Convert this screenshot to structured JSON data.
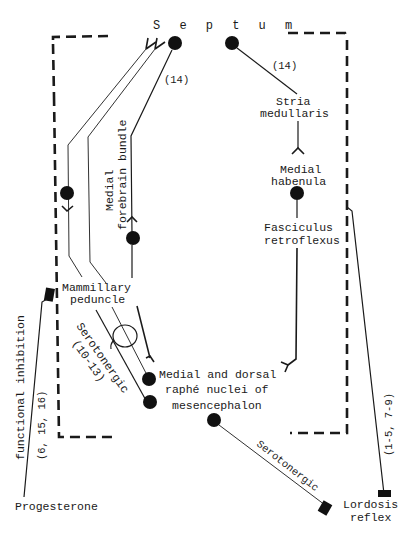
{
  "diagram": {
    "colors": {
      "ink": "#1a1a1a",
      "background": "#ffffff"
    },
    "labels": {
      "septum": "S e p t u m",
      "ref_14_left": "(14)",
      "ref_14_right": "(14)",
      "stria_1": "Stria",
      "stria_2": "medullaris",
      "medial_habenula_1": "Medial",
      "medial_habenula_2": "habenula",
      "fasciculus_1": "Fasciculus",
      "fasciculus_2": "retroflexus",
      "mfb_1": "Medial",
      "mfb_2": "forebrain bundle",
      "mammillary_1": "Mammillary",
      "mammillary_2": "peduncle",
      "serotonergic_left_1": "Serotonergic",
      "serotonergic_left_2": "(10-13)",
      "raphe_1": "Medial and dorsal",
      "raphe_2": "raphé nuclei of",
      "raphe_3": "mesencephalon",
      "functional_inhibition": "functional inhibition",
      "refs_6_15_16": "(6, 15, 16)",
      "progesterone": "Progesterone",
      "serotonergic_right": "Serotonergic",
      "refs_1_5_7_9": "(1-5, 7-9)",
      "lordosis_1": "Lordosis",
      "lordosis_2": "reflex"
    },
    "nodes": [
      "septum-left",
      "septum-right",
      "medial-habenula",
      "mammillary-neuron",
      "mfb-neuron",
      "raphe-upper",
      "raphe-lower",
      "raphe-output"
    ],
    "terminals": [
      "progesterone-terminal",
      "lordosis-terminal",
      "serotonergic-terminal"
    ]
  }
}
